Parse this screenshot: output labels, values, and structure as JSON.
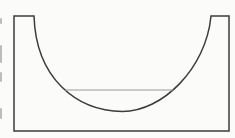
{
  "figure": {
    "label": "1",
    "content": "line-drawing cross-section of a basin vessel with curved inner bowl and liquid level line"
  },
  "colors": {
    "background": "#fbfbf9",
    "outline": "#3c3c3c",
    "liquid_line": "#9a9a9a",
    "label_text": "#2f2f2f"
  }
}
